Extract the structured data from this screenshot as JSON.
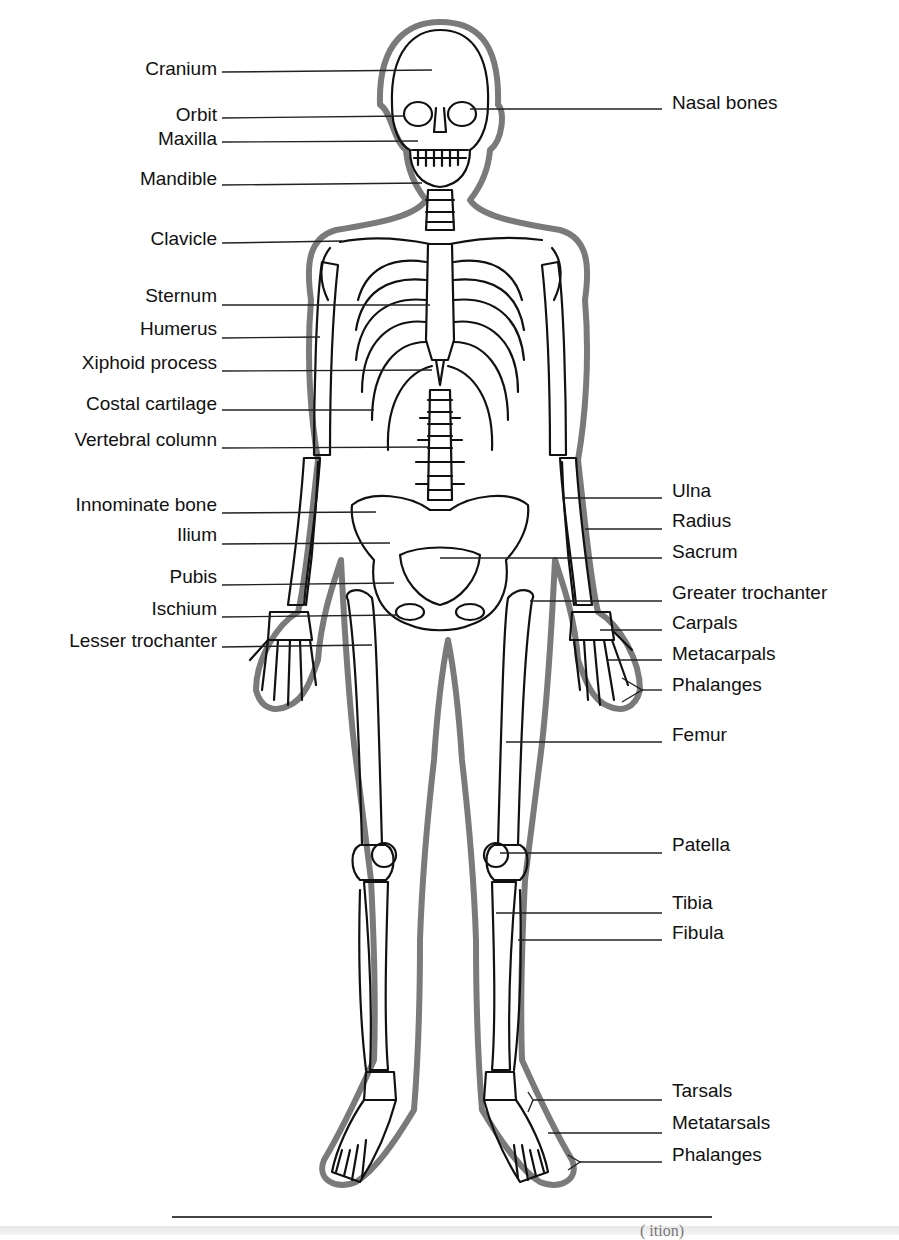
{
  "diagram": {
    "type": "labeled anatomical diagram",
    "colors": {
      "ink": "#111111",
      "outline_gray": "#777777",
      "background": "#ffffff"
    },
    "left_labels": [
      {
        "text": "Cranium",
        "y": 70
      },
      {
        "text": "Orbit",
        "y": 116
      },
      {
        "text": "Maxilla",
        "y": 141
      },
      {
        "text": "Mandible",
        "y": 184
      },
      {
        "text": "Clavicle",
        "y": 242
      },
      {
        "text": "Sternum",
        "y": 304
      },
      {
        "text": "Humerus",
        "y": 337
      },
      {
        "text": "Xiphoid process",
        "y": 370
      },
      {
        "text": "Costal cartilage",
        "y": 410
      },
      {
        "text": "Vertebral column",
        "y": 447
      },
      {
        "text": "Innominate bone",
        "y": 512
      },
      {
        "text": "Ilium",
        "y": 543
      },
      {
        "text": "Pubis",
        "y": 584
      },
      {
        "text": "Ischium",
        "y": 616
      },
      {
        "text": "Lesser trochanter",
        "y": 646
      }
    ],
    "right_labels": [
      {
        "text": "Nasal bones",
        "y": 109
      },
      {
        "text": "Ulna",
        "y": 498
      },
      {
        "text": "Radius",
        "y": 529
      },
      {
        "text": "Sacrum",
        "y": 558
      },
      {
        "text": "Greater trochanter",
        "y": 601
      },
      {
        "text": "Carpals",
        "y": 631
      },
      {
        "text": "Metacarpals",
        "y": 661
      },
      {
        "text": "Phalanges",
        "y": 692
      },
      {
        "text": "Femur",
        "y": 742
      },
      {
        "text": "Patella",
        "y": 853
      },
      {
        "text": "Tibia",
        "y": 911
      },
      {
        "text": "Fibula",
        "y": 942
      },
      {
        "text": "Tarsals",
        "y": 1099
      },
      {
        "text": "Metatarsals",
        "y": 1132
      },
      {
        "text": "Phalanges",
        "y": 1163
      }
    ],
    "footer": {
      "caption_partial": "(               ition)"
    }
  }
}
